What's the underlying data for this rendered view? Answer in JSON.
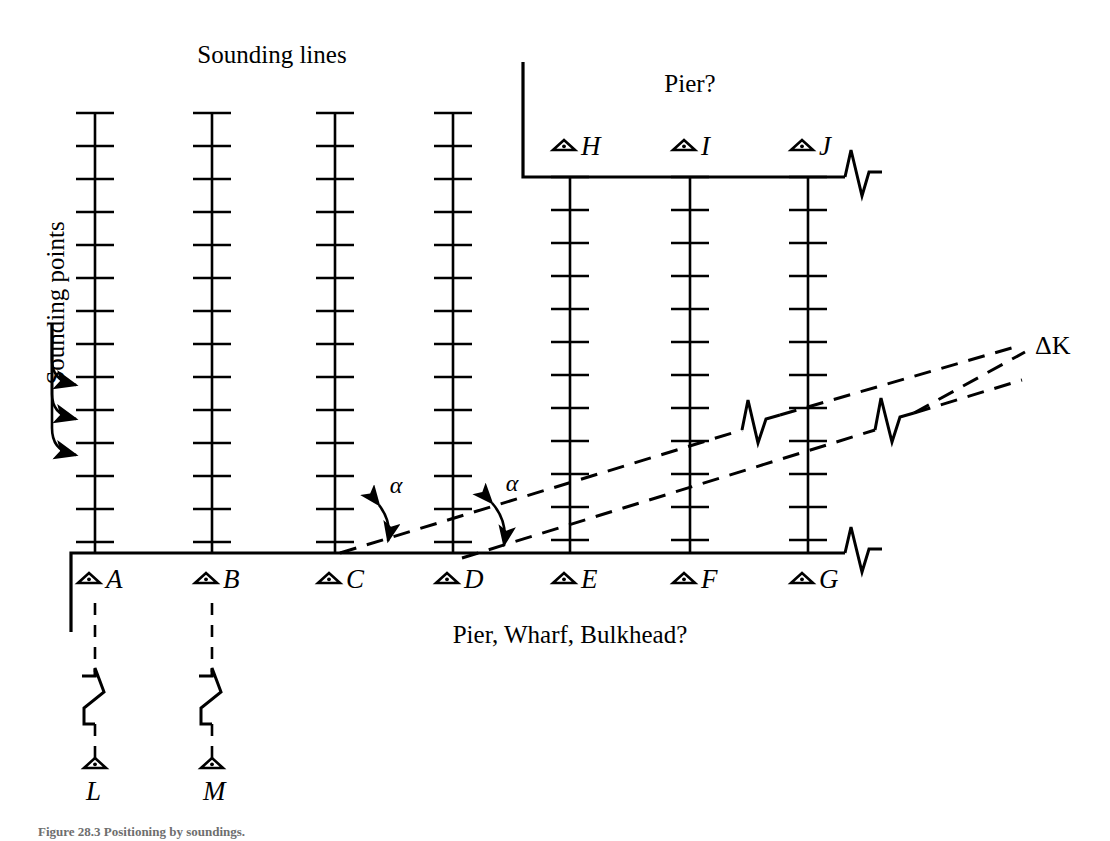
{
  "figure": {
    "title_top": "Sounding lines",
    "label_left_rotated": "Sounding points",
    "label_pier_top": "Pier?",
    "label_pier_bottom": "Pier, Wharf, Bulkhead?",
    "angle_symbol_1": "α",
    "angle_symbol_2": "α",
    "caption": "Figure 28.3   Positioning by soundings."
  },
  "stations": {
    "bottom_row": [
      {
        "id": "station-a",
        "letter": "A",
        "x": 95
      },
      {
        "id": "station-b",
        "letter": "B",
        "x": 212
      },
      {
        "id": "station-c",
        "letter": "C",
        "x": 335
      },
      {
        "id": "station-d",
        "letter": "D",
        "x": 453
      },
      {
        "id": "station-e",
        "letter": "E",
        "x": 570
      },
      {
        "id": "station-f",
        "letter": "F",
        "x": 690
      },
      {
        "id": "station-g",
        "letter": "G",
        "x": 808
      }
    ],
    "top_row": [
      {
        "id": "station-h",
        "letter": "H",
        "x": 570
      },
      {
        "id": "station-i",
        "letter": "I",
        "x": 690
      },
      {
        "id": "station-j",
        "letter": "J",
        "x": 808
      }
    ],
    "lower_row": [
      {
        "id": "station-l",
        "letter": "L",
        "x": 95
      },
      {
        "id": "station-m",
        "letter": "M",
        "x": 212
      }
    ],
    "remote": [
      {
        "id": "station-k",
        "letter": "K",
        "prefix": "Δ",
        "x": 1035,
        "y": 345
      }
    ]
  },
  "sounding_lines": {
    "tick_count": 14,
    "tick_spacing": 33,
    "tick_half_width": 19,
    "top_y": 113,
    "bottom_y": 553,
    "columns_full": [
      95,
      212,
      335,
      453
    ],
    "columns_from_pier": [
      570,
      690,
      808
    ],
    "pier_top_y": 177
  },
  "structures": {
    "bottom_quay_y": 553,
    "bottom_quay_x1": 71,
    "bottom_quay_x2": 845,
    "bottom_quay_left_edge_bottom_y": 632,
    "top_pier_y": 177,
    "top_pier_x1": 523,
    "top_pier_x2": 845,
    "top_pier_left_edge_top_y": 62
  },
  "sight_lines": {
    "from_c": {
      "x1": 340,
      "y1": 553,
      "x2": 1022,
      "y2": 345
    },
    "from_d": {
      "x1": 462,
      "y1": 558,
      "x2": 1022,
      "y2": 352
    }
  },
  "colors": {
    "ink": "#000000",
    "paper": "#ffffff",
    "caption": "#6e6e6e"
  }
}
